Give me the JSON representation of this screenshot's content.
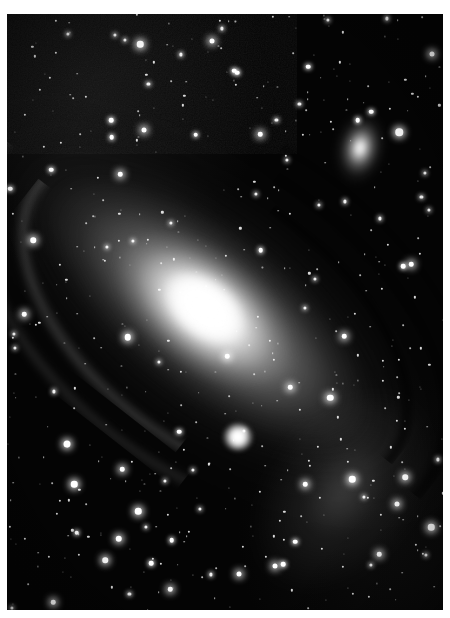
{
  "image": {
    "kind": "astrophotograph",
    "subject_title": "Andromeda Galaxy (M31)",
    "rendering": "grayscale",
    "border_color": "#ffffff",
    "sky_color": "#040404",
    "star_color": "#ffffff",
    "core_color": "#ffffff",
    "frame": {
      "left": 7,
      "top": 14,
      "width": 436,
      "height": 596
    }
  },
  "objects": [
    {
      "name": "m31",
      "label": "Andromeda Galaxy (M31)",
      "type": "spiral-galaxy",
      "center_pct": [
        46,
        50
      ],
      "position_angle_deg": 38,
      "core_brightness": "saturated-white",
      "notes": "large inclined spiral with dark dust lanes on the upper-right flank"
    },
    {
      "name": "m110",
      "label": "NGC 205 (M110)",
      "type": "elliptical-satellite-galaxy",
      "center_pct": [
        81,
        22.5
      ],
      "core_brightness": "bright",
      "notes": "elongated diffuse companion, upper right of frame"
    },
    {
      "name": "m32",
      "label": "NGC 221 (M32)",
      "type": "compact-elliptical-satellite-galaxy",
      "center_pct": [
        53,
        71
      ],
      "core_brightness": "bright-compact",
      "notes": "small round companion below the galaxy core"
    }
  ],
  "features": [
    {
      "name": "dust-lane-inner",
      "tone": "dark"
    },
    {
      "name": "dust-lane-middle",
      "tone": "dark"
    },
    {
      "name": "dust-lane-outer",
      "tone": "dark"
    },
    {
      "name": "spiral-arm-southwest-inner",
      "tone": "bright"
    },
    {
      "name": "spiral-arm-southwest-outer",
      "tone": "bright"
    },
    {
      "name": "outer-arm-knots-southeast",
      "tone": "bright"
    }
  ],
  "starfield": {
    "description": "dense field of foreground stars across the whole frame",
    "approximate_count": 520,
    "seed": 20240817
  }
}
